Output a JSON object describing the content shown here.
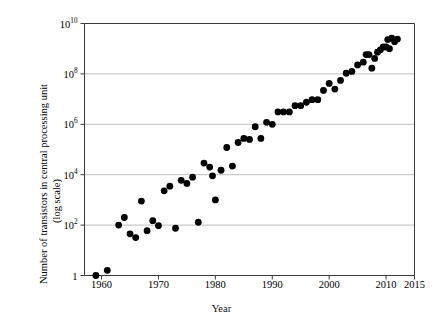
{
  "chart_data": {
    "type": "scatter",
    "title": "",
    "xlabel": "Year",
    "ylabel": "Number of transistors in central processing unit (log scale)",
    "ylabel_line1": "Number of transistors in central processing unit",
    "ylabel_line2": "(log scale)",
    "xlim": [
      1957,
      2015
    ],
    "ylim": [
      1,
      10000000000
    ],
    "yscale": "log",
    "grid": "horizontal",
    "legend": "none",
    "marker": "filled-circle",
    "marker_color": "#000000",
    "xticks": [
      1960,
      1970,
      1980,
      1990,
      2000,
      2010,
      2015
    ],
    "xtick_labels": [
      "1960",
      "1970",
      "1980",
      "1990",
      "2000",
      "2010",
      "2015"
    ],
    "yticks": [
      1,
      100,
      10000,
      1000000,
      100000000,
      10000000000
    ],
    "ytick_labels": [
      "1",
      "10²",
      "10⁴",
      "10⁶",
      "10⁸",
      "10¹⁰"
    ],
    "ytick_mantissa": [
      "1",
      "10",
      "10",
      "10",
      "10",
      "10"
    ],
    "ytick_exponent": [
      "",
      "2",
      "4",
      "6",
      "8",
      "10"
    ],
    "points": [
      {
        "x": 1959,
        "y": 1
      },
      {
        "x": 1961,
        "y": 1.6
      },
      {
        "x": 1963,
        "y": 100
      },
      {
        "x": 1964,
        "y": 200
      },
      {
        "x": 1965,
        "y": 45
      },
      {
        "x": 1966,
        "y": 32
      },
      {
        "x": 1967,
        "y": 900
      },
      {
        "x": 1968,
        "y": 60
      },
      {
        "x": 1969,
        "y": 150
      },
      {
        "x": 1970,
        "y": 95
      },
      {
        "x": 1971,
        "y": 2300
      },
      {
        "x": 1972,
        "y": 3500
      },
      {
        "x": 1973,
        "y": 75
      },
      {
        "x": 1974,
        "y": 6000
      },
      {
        "x": 1975,
        "y": 4500
      },
      {
        "x": 1976,
        "y": 8000
      },
      {
        "x": 1977,
        "y": 130
      },
      {
        "x": 1978,
        "y": 29000
      },
      {
        "x": 1979,
        "y": 20000
      },
      {
        "x": 1979.5,
        "y": 9000
      },
      {
        "x": 1980,
        "y": 1000
      },
      {
        "x": 1981,
        "y": 15000
      },
      {
        "x": 1982,
        "y": 120000
      },
      {
        "x": 1983,
        "y": 22000
      },
      {
        "x": 1984,
        "y": 190000
      },
      {
        "x": 1985,
        "y": 275000
      },
      {
        "x": 1986,
        "y": 250000
      },
      {
        "x": 1987,
        "y": 800000
      },
      {
        "x": 1988,
        "y": 275000
      },
      {
        "x": 1989,
        "y": 1200000
      },
      {
        "x": 1990,
        "y": 1000000
      },
      {
        "x": 1991,
        "y": 3100000
      },
      {
        "x": 1992,
        "y": 3100000
      },
      {
        "x": 1993,
        "y": 3100000
      },
      {
        "x": 1994,
        "y": 5500000
      },
      {
        "x": 1995,
        "y": 5500000
      },
      {
        "x": 1996,
        "y": 7500000
      },
      {
        "x": 1997,
        "y": 9500000
      },
      {
        "x": 1998,
        "y": 9500000
      },
      {
        "x": 1999,
        "y": 22000000
      },
      {
        "x": 2000,
        "y": 42000000
      },
      {
        "x": 2001,
        "y": 25000000
      },
      {
        "x": 2002,
        "y": 55000000
      },
      {
        "x": 2003,
        "y": 106000000
      },
      {
        "x": 2004,
        "y": 125000000
      },
      {
        "x": 2005,
        "y": 228000000
      },
      {
        "x": 2006,
        "y": 291000000
      },
      {
        "x": 2006.5,
        "y": 582000000
      },
      {
        "x": 2007,
        "y": 582000000
      },
      {
        "x": 2007.5,
        "y": 169000000
      },
      {
        "x": 2008,
        "y": 410000000
      },
      {
        "x": 2008.5,
        "y": 731000000
      },
      {
        "x": 2009,
        "y": 904000000
      },
      {
        "x": 2009.5,
        "y": 1170000000
      },
      {
        "x": 2010,
        "y": 1170000000
      },
      {
        "x": 2010.3,
        "y": 2300000000
      },
      {
        "x": 2010.6,
        "y": 1000000000
      },
      {
        "x": 2011,
        "y": 2600000000
      },
      {
        "x": 2011.5,
        "y": 1900000000
      },
      {
        "x": 2012,
        "y": 2400000000
      }
    ]
  },
  "axes": {
    "x_title": "Year",
    "y_title_line1": "Number of transistors in central processing unit",
    "y_title_line2": "(log scale)"
  },
  "style": {
    "marker_color": "#000000",
    "gridline_color": "#b5b5b5",
    "axis_color": "#3a3a3a",
    "background": "#ffffff"
  }
}
